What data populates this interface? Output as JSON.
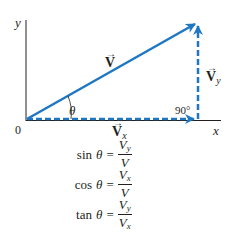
{
  "colors": {
    "vector": "#1f77c4",
    "axis": "#231f20",
    "text": "#231f20"
  },
  "axes": {
    "x_label": "x",
    "y_label": "y",
    "origin_label": "0"
  },
  "vectors": {
    "V": {
      "label": "V",
      "arrow": "→"
    },
    "Vx": {
      "label": "V",
      "sub": "x",
      "arrow": "→"
    },
    "Vy": {
      "label": "V",
      "sub": "y",
      "arrow": "→"
    }
  },
  "angle": {
    "theta": "θ",
    "right_angle": "90°"
  },
  "equations": [
    {
      "fn": "sin",
      "theta": "θ",
      "equals": "=",
      "num": "V",
      "num_sub": "y",
      "den": "V",
      "den_sub": ""
    },
    {
      "fn": "cos",
      "theta": "θ",
      "equals": "=",
      "num": "V",
      "num_sub": "x",
      "den": "V",
      "den_sub": ""
    },
    {
      "fn": "tan",
      "theta": "θ",
      "equals": "=",
      "num": "V",
      "num_sub": "y",
      "den": "V",
      "den_sub": "x"
    }
  ]
}
